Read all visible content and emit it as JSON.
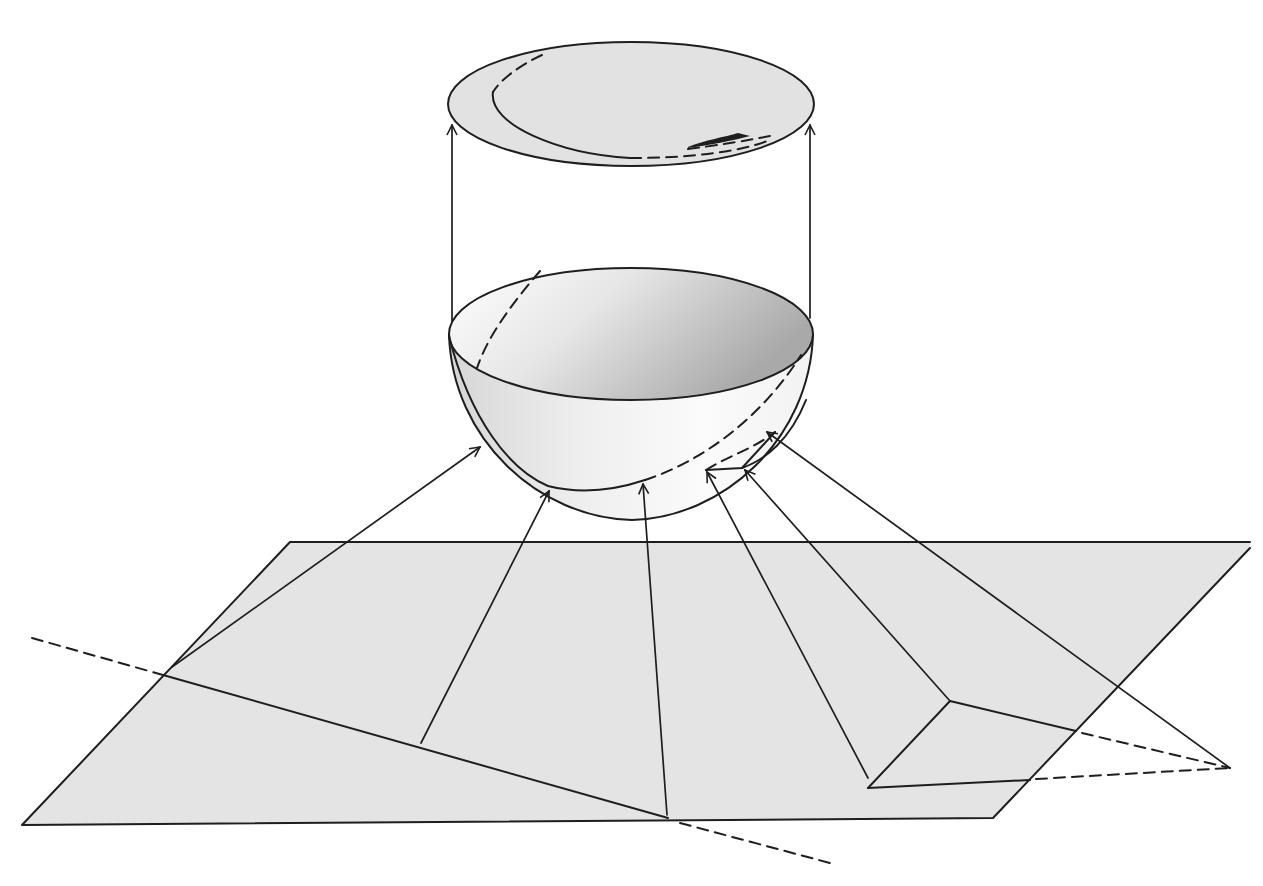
{
  "figure": {
    "type": "diagram",
    "colors": {
      "background": "#ffffff",
      "line": "#1e1e1e",
      "plane_fill": "#e4e4e4",
      "disc_fill": "#e2e2e2",
      "bowl_inner_light": "#ffffff",
      "bowl_inner_dark": "#a9a9a9",
      "bowl_outer_light": "#f7f7f7",
      "bowl_outer_dark": "#cfcfcf"
    },
    "elements": {
      "top_disc": {
        "cx": 631,
        "cy": 104,
        "rx": 183,
        "ry": 62
      },
      "hemisphere_rim": {
        "cx": 631,
        "cy": 334,
        "rx": 182,
        "ry": 66
      },
      "plane_corners": [
        [
          290,
          542
        ],
        [
          1250,
          542
        ],
        [
          993,
          818
        ],
        [
          22,
          825
        ]
      ],
      "upward_arrows": 2,
      "rays_from_plane_to_hemisphere": 6,
      "dashed_extensions": 3
    }
  }
}
